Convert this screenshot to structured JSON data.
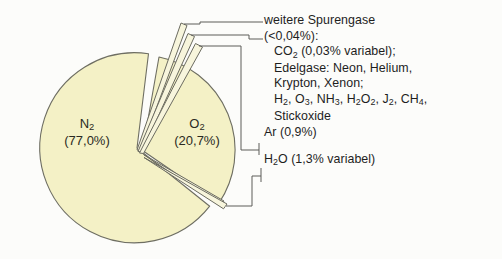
{
  "figure": {
    "background_color": "#fcfcfa",
    "pie_fill_color": "#f4f1c6",
    "outline_color": "#6e6e62",
    "text_color": "#1e1e1e"
  },
  "slices": {
    "n2": {
      "name": "N",
      "sub": "2",
      "value_label": "(77,0%)"
    },
    "o2": {
      "name": "O",
      "sub": "2",
      "value_label": "(20,7%)"
    }
  },
  "legend": {
    "line1": "weitere Spurengase",
    "line2": "(<0,04%):",
    "line3_a": "CO",
    "line3_sub": "2",
    "line3_b": " (0,03% variabel);",
    "line4": "Edelgase: Neon, Helium,",
    "line5": "Krypton, Xenon;",
    "line6_parts": [
      {
        "t": "H"
      },
      {
        "s": "2"
      },
      {
        "t": ", O"
      },
      {
        "s": "3"
      },
      {
        "t": ", NH"
      },
      {
        "s": "3"
      },
      {
        "t": ", H"
      },
      {
        "s": "2"
      },
      {
        "t": "O"
      },
      {
        "s": "2"
      },
      {
        "t": ", J"
      },
      {
        "s": "2"
      },
      {
        "t": ", CH"
      },
      {
        "s": "4"
      },
      {
        "t": ","
      }
    ],
    "line7": "Stickoxide",
    "line8": "Ar (0,9%)",
    "line9_parts": [
      {
        "t": "H"
      },
      {
        "s": "2"
      },
      {
        "t": "O (1,3% variabel)"
      }
    ]
  },
  "chart_data": {
    "type": "pie",
    "categories": [
      "N2 (Stickstoff)",
      "O2 (Sauerstoff)",
      "Ar (Argon)",
      "H2O (Wasserdampf)",
      "weitere Spurengase"
    ],
    "values": [
      77.0,
      20.7,
      0.9,
      1.3,
      0.04
    ],
    "value_labels": [
      "77,0%",
      "20,7%",
      "0,9%",
      "1,3% variabel",
      "<0,04%"
    ],
    "units": "Volumenprozent",
    "legend_position": "right",
    "grid": false,
    "annotations": [
      "weitere Spurengase (<0,04%): CO2 (0,03% variabel); Edelgase: Neon, Helium, Krypton, Xenon; H2, O3, NH3, H2O2, J2, CH4, Stickoxide",
      "Ar (0,9%)",
      "H2O (1,3% variabel)"
    ],
    "exploded_slices": [
      "weitere Spurengase",
      "Ar (Argon)",
      "H2O (Wasserdampf)",
      "O2 (Sauerstoff)"
    ]
  }
}
